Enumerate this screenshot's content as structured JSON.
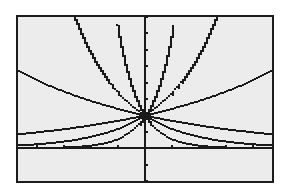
{
  "chart_data": {
    "type": "line",
    "title": "",
    "xlabel": "",
    "ylabel": "",
    "description": "Graphing calculator plot of exponential functions y = b^x, all passing through (0, 1)",
    "window": {
      "xmin": -4.7,
      "xmax": 4.7,
      "xscl": 1,
      "ymin": -1,
      "ymax": 4,
      "yscl": 0.5
    },
    "xlim": [
      -4.7,
      4.7
    ],
    "ylim": [
      -1,
      4
    ],
    "grid": false,
    "legend": null,
    "intersection_point": {
      "x": 0,
      "y": 1
    },
    "series": [
      {
        "name": "y=1.2^x",
        "base": 1.2
      },
      {
        "name": "y=1.7^x",
        "base": 1.7
      },
      {
        "name": "y=3.6^x",
        "base": 3.6
      },
      {
        "name": "y=(1/1.2)^x",
        "base": 0.8333
      },
      {
        "name": "y=(1/1.7)^x",
        "base": 0.5882
      },
      {
        "name": "y=(1/3.6)^x",
        "base": 0.2778
      }
    ],
    "colors": {
      "line": "#1a1a1a",
      "screen_bg": "#ececec",
      "frame": "#1c1c1c",
      "page_bg": "#ffffff"
    }
  }
}
